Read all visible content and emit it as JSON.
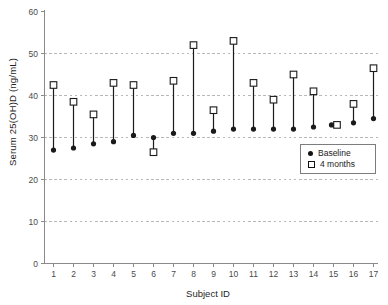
{
  "figure": {
    "y_axis_title": "Serum 25(OH)D (ng/mL)",
    "x_axis_title": "Subject ID"
  },
  "legend": {
    "items": [
      {
        "label": "Baseline",
        "marker": "filled-circle"
      },
      {
        "label": "4 months",
        "marker": "open-square"
      }
    ]
  },
  "colors": {
    "marker_and_line": "#1a1a1a",
    "axis": "#8a8a8a",
    "tick_text": "#4a4a4a",
    "gridline": "#b8b8b8",
    "background": "#ffffff",
    "legend_border": "#7d7d7d"
  },
  "chart_data": {
    "type": "scatter",
    "subtype": "paired baseline/follow-up per subject, points joined by vertical lines",
    "title": "",
    "xlabel": "Subject ID",
    "ylabel": "Serum 25(OH)D (ng/mL)",
    "categories": [
      1,
      2,
      3,
      4,
      5,
      6,
      7,
      8,
      9,
      10,
      11,
      12,
      13,
      14,
      15,
      16,
      17
    ],
    "series": [
      {
        "name": "Baseline",
        "marker": "filled-circle",
        "values": [
          27,
          27.5,
          28.5,
          29,
          30.5,
          30,
          31,
          31,
          31.5,
          32,
          32,
          32,
          32,
          32.5,
          33,
          33.5,
          34.5
        ]
      },
      {
        "name": "4 months",
        "marker": "open-square",
        "values": [
          42.5,
          38.5,
          35.5,
          43,
          42.5,
          26.5,
          43.5,
          52,
          36.5,
          53,
          43,
          39,
          45,
          41,
          33,
          38,
          46.5
        ]
      }
    ],
    "ylim": [
      0,
      60
    ],
    "yticks": [
      0,
      10,
      20,
      30,
      40,
      50,
      60
    ],
    "gridlines": {
      "y": [
        10,
        20,
        30,
        40,
        50
      ],
      "style": "dashed"
    },
    "grid": "horizontal-only",
    "legend_position": "inside-right-middle"
  }
}
